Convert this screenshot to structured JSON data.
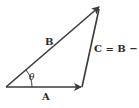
{
  "diagram": {
    "type": "vector-triangle",
    "colors": {
      "stroke": "#3a3a3a",
      "text": "#2a2a2a",
      "background": "#ffffff"
    },
    "vectors": [
      {
        "id": "A",
        "label": "A",
        "from": [
          6,
          87
        ],
        "to": [
          82,
          87
        ]
      },
      {
        "id": "B",
        "label": "B",
        "from": [
          6,
          87
        ],
        "to": [
          100,
          6
        ]
      },
      {
        "id": "C",
        "label": "C = B − A",
        "from": [
          82,
          87
        ],
        "to": [
          100,
          6
        ]
      }
    ],
    "angle_label": "θ"
  }
}
